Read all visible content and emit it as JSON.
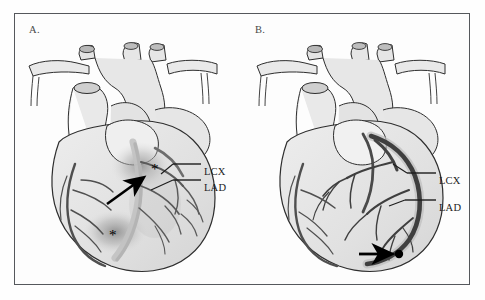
{
  "figure": {
    "type": "medical-illustration",
    "background_color": "#fefefe",
    "frame_color": "#55585c"
  },
  "panels": [
    {
      "id": "A",
      "letter": "A.",
      "condition": "occluded-lad-with-ischemia",
      "labels": [
        {
          "id": "lcx",
          "text": "LCX",
          "vessel": "left circumflex artery"
        },
        {
          "id": "lad",
          "text": "LAD",
          "vessel": "left anterior descending artery"
        }
      ],
      "markers": [
        {
          "id": "arrow",
          "type": "arrow",
          "direction": "up-right",
          "points_to": "lad-occlusion-site"
        },
        {
          "id": "asterisk-upper",
          "type": "asterisk",
          "glyph": "*",
          "marks": "ischemic-myocardium-upper"
        },
        {
          "id": "asterisk-lower",
          "type": "asterisk",
          "glyph": "*",
          "marks": "ischemic-myocardium-apical"
        }
      ],
      "vessel_tone": "pale",
      "shading": "diffuse-grey-hypoperfusion"
    },
    {
      "id": "B",
      "letter": "B.",
      "condition": "patent-revascularized-lad",
      "labels": [
        {
          "id": "lcx",
          "text": "LCX",
          "vessel": "left circumflex artery"
        },
        {
          "id": "lad",
          "text": "LAD",
          "vessel": "left anterior descending artery"
        }
      ],
      "markers": [
        {
          "id": "arrow",
          "type": "arrow",
          "direction": "right",
          "points_to": "distal-lad-stent-site"
        }
      ],
      "vessel_tone": "dark-filled",
      "shading": "uniform-perfusion"
    }
  ],
  "colors": {
    "outline": "#2e2e2e",
    "myocardium_light": "#e8e8e8",
    "myocardium_mid": "#d6d6d6",
    "vessel_pale": "#b9b9b9",
    "vessel_dark": "#4a4a4a",
    "marker_black": "#000000",
    "ischemia_shade": "#a8a8a8"
  }
}
